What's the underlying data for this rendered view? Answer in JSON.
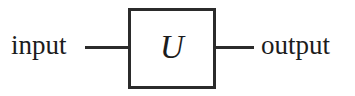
{
  "diagram": {
    "type": "quantum-circuit-block",
    "background_color": "#ffffff",
    "stroke_color": "#2b2b2b",
    "text_color": "#1c1c1c",
    "input": {
      "label": "input"
    },
    "output": {
      "label": "output"
    },
    "gate": {
      "symbol": "U"
    }
  }
}
